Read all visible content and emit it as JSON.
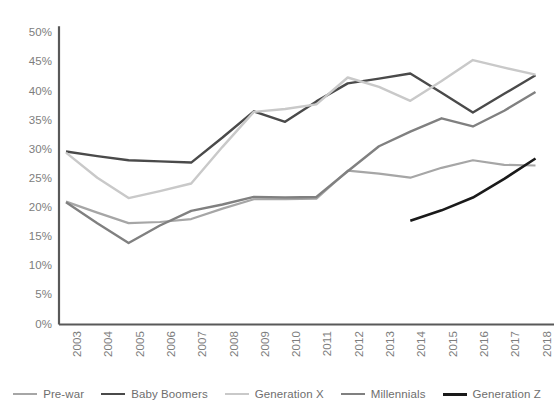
{
  "chart_data": {
    "type": "line",
    "title": "",
    "subtitle": "",
    "xlabel": "",
    "ylabel": "",
    "x": [
      "2003",
      "2004",
      "2005",
      "2006",
      "2007",
      "2008",
      "2009",
      "2010",
      "2011",
      "2012",
      "2013",
      "2014",
      "2015",
      "2016",
      "2017",
      "2018"
    ],
    "ylim": [
      0,
      50
    ],
    "yticks": [
      0,
      5,
      10,
      15,
      20,
      25,
      30,
      35,
      40,
      45,
      50
    ],
    "ytick_labels": [
      "0%",
      "5%",
      "10%",
      "15%",
      "20%",
      "25%",
      "30%",
      "35%",
      "40%",
      "45%",
      "50%"
    ],
    "xtick_labels": [
      "2003",
      "2004",
      "2005",
      "2006",
      "2007",
      "2008",
      "2009",
      "2010",
      "2011",
      "2012",
      "2013",
      "2014",
      "2015",
      "2016",
      "2017",
      "2018"
    ],
    "grid": false,
    "legend_position": "bottom",
    "y_axis_format": "percent",
    "note_last_category_clipped": "2018",
    "series": [
      {
        "name": "Pre-war",
        "color": "#a6a6a6",
        "width": 2.2,
        "values": [
          21.1,
          19.2,
          17.4,
          17.6,
          18.1,
          19.9,
          21.5,
          21.5,
          21.6,
          26.4,
          25.9,
          25.2,
          26.9,
          28.2,
          27.4,
          27.3
        ]
      },
      {
        "name": "Baby Boomers",
        "color": "#4a4a4a",
        "width": 2.4,
        "values": [
          29.7,
          28.9,
          28.2,
          28.0,
          27.8,
          32.1,
          36.6,
          34.8,
          38.3,
          41.4,
          42.2,
          43.1,
          39.8,
          36.4,
          39.6,
          42.8
        ]
      },
      {
        "name": "Generation X",
        "color": "#c9c9c9",
        "width": 2.4,
        "values": [
          29.5,
          25.2,
          21.7,
          22.9,
          24.2,
          30.5,
          36.5,
          37.0,
          37.8,
          42.4,
          40.8,
          38.4,
          41.8,
          45.4,
          44.1,
          42.9
        ]
      },
      {
        "name": "Millennials",
        "color": "#808080",
        "width": 2.4,
        "values": [
          21.0,
          17.4,
          14.0,
          17.0,
          19.5,
          20.6,
          21.9,
          21.8,
          21.9,
          26.3,
          30.6,
          33.1,
          35.4,
          34.0,
          36.7,
          39.9
        ]
      },
      {
        "name": "Generation Z",
        "color": "#1a1a1a",
        "width": 2.6,
        "values": [
          null,
          null,
          null,
          null,
          null,
          null,
          null,
          null,
          null,
          null,
          null,
          17.8,
          19.6,
          21.8,
          25.0,
          28.5
        ]
      }
    ]
  },
  "axis": {
    "axis_color": "#595959",
    "tick_label_color": "#7d7d7d"
  },
  "legend": {
    "items": [
      {
        "label": "Pre-war",
        "color": "#a6a6a6",
        "width": 2.4
      },
      {
        "label": "Baby Boomers",
        "color": "#4a4a4a",
        "width": 2.8
      },
      {
        "label": "Generation X",
        "color": "#c9c9c9",
        "width": 2.8
      },
      {
        "label": "Millennials",
        "color": "#808080",
        "width": 2.8
      },
      {
        "label": "Generation Z",
        "color": "#1a1a1a",
        "width": 3.0
      }
    ]
  }
}
